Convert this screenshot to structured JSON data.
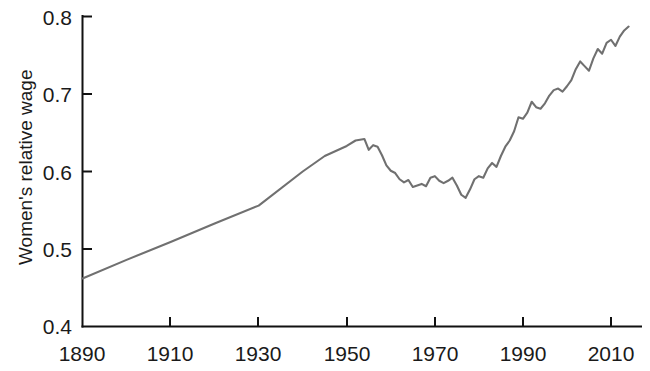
{
  "chart_data": {
    "type": "line",
    "title": "",
    "subtitle": "",
    "xlabel": "",
    "ylabel": "Women's relative wage",
    "xlim": [
      1890,
      2015
    ],
    "ylim": [
      0.4,
      0.8
    ],
    "grid": false,
    "legend": null,
    "line_color": "#707070",
    "axis_color": "#111111",
    "x_ticks": [
      1890,
      1910,
      1930,
      1950,
      1970,
      1990,
      2010
    ],
    "x_tick_labels": [
      "1890",
      "1910",
      "1930",
      "1950",
      "1970",
      "1990",
      "2010"
    ],
    "y_ticks": [
      0.4,
      0.5,
      0.6,
      0.7,
      0.8
    ],
    "y_tick_labels": [
      "0.4",
      "0.5",
      "0.6",
      "0.7",
      "0.8"
    ],
    "series": [
      {
        "name": "Women's relative wage",
        "x": [
          1890,
          1900,
          1910,
          1920,
          1930,
          1940,
          1945,
          1950,
          1952,
          1954,
          1955,
          1956,
          1957,
          1958,
          1959,
          1960,
          1961,
          1962,
          1963,
          1964,
          1965,
          1966,
          1967,
          1968,
          1969,
          1970,
          1971,
          1972,
          1973,
          1974,
          1975,
          1976,
          1977,
          1978,
          1979,
          1980,
          1981,
          1982,
          1983,
          1984,
          1985,
          1986,
          1987,
          1988,
          1989,
          1990,
          1991,
          1992,
          1993,
          1994,
          1995,
          1996,
          1997,
          1998,
          1999,
          2000,
          2001,
          2002,
          2003,
          2004,
          2005,
          2006,
          2007,
          2008,
          2009,
          2010,
          2011,
          2012,
          2013,
          2014
        ],
        "y": [
          0.462,
          0.486,
          0.509,
          0.533,
          0.556,
          0.6,
          0.62,
          0.633,
          0.64,
          0.642,
          0.628,
          0.634,
          0.632,
          0.621,
          0.608,
          0.601,
          0.598,
          0.59,
          0.586,
          0.589,
          0.58,
          0.582,
          0.584,
          0.581,
          0.592,
          0.594,
          0.588,
          0.585,
          0.588,
          0.592,
          0.582,
          0.57,
          0.566,
          0.577,
          0.59,
          0.594,
          0.592,
          0.604,
          0.611,
          0.606,
          0.62,
          0.632,
          0.64,
          0.652,
          0.67,
          0.668,
          0.676,
          0.69,
          0.683,
          0.681,
          0.688,
          0.698,
          0.705,
          0.707,
          0.703,
          0.71,
          0.718,
          0.732,
          0.742,
          0.736,
          0.73,
          0.746,
          0.758,
          0.752,
          0.766,
          0.77,
          0.762,
          0.774,
          0.782,
          0.787
        ]
      }
    ]
  },
  "axis": {
    "y_title": "Women's relative wage"
  }
}
